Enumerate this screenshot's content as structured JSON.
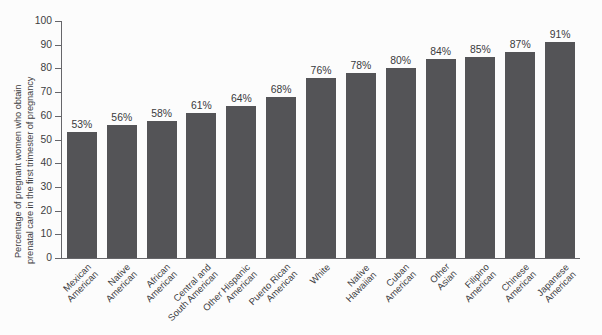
{
  "chart_data": {
    "type": "bar",
    "title": "",
    "xlabel": "",
    "ylabel_line1": "Percentage of pregnant women who obtain",
    "ylabel_line2": "prenatal care in the first trimester of pregnancy",
    "ylim": [
      0,
      100
    ],
    "ytick_step": 10,
    "yticks": [
      "100",
      "90",
      "80",
      "70",
      "60",
      "50",
      "40",
      "30",
      "20",
      "10",
      "0"
    ],
    "grid": false,
    "legend": "none",
    "bar_color": "#545457",
    "background_color": "#fcfcfc",
    "axis_color": "#66666a",
    "categories": [
      "Mexican American",
      "Native American",
      "African American",
      "Central and South American",
      "Other Hispanic American",
      "Puerto Rican American",
      "White",
      "Native Hawaiian",
      "Cuban American",
      "Other Asian",
      "Filipino American",
      "Chinese American",
      "Japanese American"
    ],
    "category_lines": [
      [
        "Mexican",
        "American"
      ],
      [
        "Native",
        "American"
      ],
      [
        "African",
        "American"
      ],
      [
        "Central and",
        "South American"
      ],
      [
        "Other Hispanic",
        "American"
      ],
      [
        "Puerto Rican",
        "American"
      ],
      [
        "White",
        ""
      ],
      [
        "Native",
        "Hawaiian"
      ],
      [
        "Cuban",
        "American"
      ],
      [
        "Other",
        "Asian"
      ],
      [
        "Filipino",
        "American"
      ],
      [
        "Chinese",
        "American"
      ],
      [
        "Japanese",
        "American"
      ]
    ],
    "values": [
      53,
      56,
      58,
      61,
      64,
      68,
      76,
      78,
      80,
      84,
      85,
      87,
      91
    ],
    "value_labels": [
      "53%",
      "56%",
      "58%",
      "61%",
      "64%",
      "68%",
      "76%",
      "78%",
      "80%",
      "84%",
      "85%",
      "87%",
      "91%"
    ]
  }
}
